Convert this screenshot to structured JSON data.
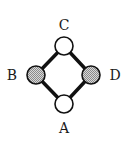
{
  "diagram": {
    "type": "undirected-graph",
    "nodes": [
      {
        "id": "A",
        "label": "A",
        "cx": 64,
        "cy": 104,
        "r": 9,
        "fill": "#ffffff",
        "shaded": false,
        "label_x": 64,
        "label_y": 133
      },
      {
        "id": "B",
        "label": "B",
        "cx": 36,
        "cy": 75,
        "r": 9,
        "fill": "#b8b8b8",
        "shaded": true,
        "label_x": 12,
        "label_y": 80
      },
      {
        "id": "C",
        "label": "C",
        "cx": 64,
        "cy": 46,
        "r": 9,
        "fill": "#ffffff",
        "shaded": false,
        "label_x": 64,
        "label_y": 30
      },
      {
        "id": "D",
        "label": "D",
        "cx": 91,
        "cy": 75,
        "r": 9,
        "fill": "#b8b8b8",
        "shaded": true,
        "label_x": 115,
        "label_y": 80
      }
    ],
    "edges": [
      {
        "from": "C",
        "to": "B"
      },
      {
        "from": "C",
        "to": "D"
      },
      {
        "from": "B",
        "to": "A"
      },
      {
        "from": "D",
        "to": "A"
      }
    ],
    "colors": {
      "edge": "#111111",
      "node_stroke": "#111111",
      "shaded_fill": "#b8b8b8",
      "unshaded_fill": "#ffffff",
      "label": "#1a1a1a"
    }
  }
}
